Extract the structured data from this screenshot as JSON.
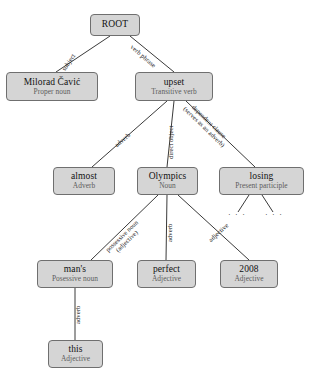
{
  "diagram": {
    "type": "dependency-parse-tree",
    "colors": {
      "node_fill": "#d5d5d5",
      "node_border": "#6f6f6f",
      "edge": "#3a3a3a",
      "word_text": "#111111",
      "pos_text": "#5c5c5c",
      "background": "#ffffff"
    },
    "nodes": [
      {
        "id": "root",
        "word": "ROOT",
        "pos": ""
      },
      {
        "id": "milorad",
        "word": "Milorad Čavić",
        "pos": "Proper noun"
      },
      {
        "id": "upset",
        "word": "upset",
        "pos": "Transitive verb"
      },
      {
        "id": "almost",
        "word": "almost",
        "pos": "Adverb"
      },
      {
        "id": "olympics",
        "word": "Olympics",
        "pos": "Noun"
      },
      {
        "id": "losing",
        "word": "losing",
        "pos": "Present participle"
      },
      {
        "id": "mans",
        "word": "man's",
        "pos": "Posessive noun"
      },
      {
        "id": "perfect",
        "word": "perfect",
        "pos": "Adjective"
      },
      {
        "id": "y2008",
        "word": "2008",
        "pos": "Adjective"
      },
      {
        "id": "this",
        "word": "this",
        "pos": "Adjective"
      }
    ],
    "edges": [
      {
        "from": "root",
        "to": "milorad",
        "label": "subject"
      },
      {
        "from": "root",
        "to": "upset",
        "label": "verb phrase"
      },
      {
        "from": "upset",
        "to": "almost",
        "label": "adverb"
      },
      {
        "from": "upset",
        "to": "olympics",
        "label": "direct object"
      },
      {
        "from": "upset",
        "to": "losing",
        "label": "dependent clause",
        "label2": "(serves as an adverb)"
      },
      {
        "from": "olympics",
        "to": "mans",
        "label": "possessive noun",
        "label2": "(adjective)"
      },
      {
        "from": "olympics",
        "to": "perfect",
        "label": "adverb"
      },
      {
        "from": "olympics",
        "to": "y2008",
        "label": "adjective"
      },
      {
        "from": "mans",
        "to": "this",
        "label": "adverb"
      },
      {
        "from": "losing",
        "to": "ellipsis-left",
        "label": ""
      },
      {
        "from": "losing",
        "to": "ellipsis-right",
        "label": ""
      }
    ],
    "ellipses": [
      {
        "id": "ellipsis-left",
        "text": "· · ·"
      },
      {
        "id": "ellipsis-right",
        "text": "· · ·"
      }
    ]
  }
}
